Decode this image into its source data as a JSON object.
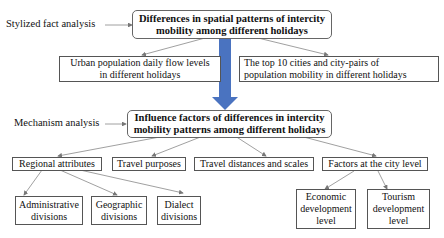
{
  "labels": {
    "stylized": "Stylized fact analysis",
    "mechanism": "Mechanism analysis"
  },
  "top": {
    "title_line1": "Differences in spatial patterns of intercity",
    "title_line2": "mobility among different holidays",
    "child1_line1": "Urban population daily flow levels",
    "child1_line2": "in different holidays",
    "child2_line1": "The top 10 cities and city-pairs of",
    "child2_line2": "population mobility in different holidays"
  },
  "mech": {
    "title_line1": "Influence factors of differences in intercity",
    "title_line2": "mobility patterns among different holidays",
    "factors": [
      "Regional attributes",
      "Travel purposes",
      "Travel distances and scales",
      "Factors at the city level"
    ]
  },
  "regional": [
    {
      "l1": "Administrative",
      "l2": "divisions"
    },
    {
      "l1": "Geographic",
      "l2": "divisions"
    },
    {
      "l1": "Dialect",
      "l2": "divisions"
    }
  ],
  "city": [
    {
      "l1": "Economic",
      "l2": "development",
      "l3": "level"
    },
    {
      "l1": "Tourism",
      "l2": "development",
      "l3": "level"
    }
  ],
  "colors": {
    "arrow": "#4a73c0",
    "edge": "#777777"
  }
}
